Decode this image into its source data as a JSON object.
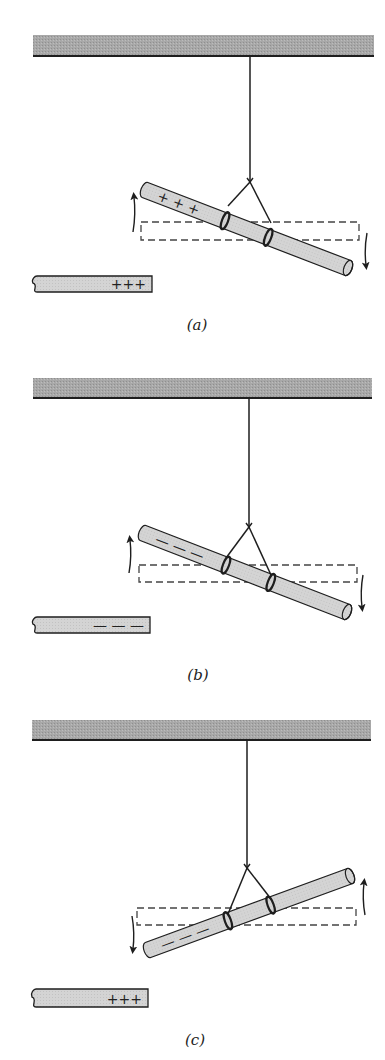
{
  "figure": {
    "colors": {
      "ceiling_fill": "#a6a6a6",
      "rod_fill": "#d2d2d2",
      "line": "#1e1e1e",
      "dashed": "#444444",
      "background": "#ffffff"
    },
    "panels": [
      {
        "id": "a",
        "caption": "(a)",
        "caption_pos": [
          197,
          325
        ],
        "suspended_rod_charge": "+ + +",
        "suspended_rod_charge_end": "left",
        "nearby_rod_charge": "+++",
        "rotation": "counterclockwise-left-up",
        "ceiling": {
          "x1": 33,
          "x2": 374,
          "top": 35,
          "bottom": 56
        },
        "string": {
          "x": 250,
          "top": 56,
          "split_y": 182
        },
        "rod": {
          "x1": 145,
          "y1": 190,
          "x2": 348,
          "y2": 268
        },
        "loops": [
          [
            228,
            213
          ],
          [
            271,
            230
          ]
        ],
        "dashed_rect": {
          "x": 141,
          "y": 222,
          "w": 218,
          "h": 18
        },
        "arrows": [
          {
            "side": "left",
            "x": 133,
            "y_from": 232,
            "y_to": 196,
            "dir": "up"
          },
          {
            "side": "right",
            "x": 367,
            "y_from": 233,
            "y_to": 266,
            "dir": "down"
          }
        ],
        "nearby_rod": {
          "x1": 33,
          "x2": 152,
          "top": 276,
          "bottom": 292
        }
      },
      {
        "id": "b",
        "caption": "(b)",
        "caption_pos": [
          198,
          675
        ],
        "suspended_rod_charge": "— — —",
        "suspended_rod_charge_end": "left",
        "nearby_rod_charge": "— — —",
        "rotation": "left-up",
        "ceiling": {
          "x1": 33,
          "x2": 372,
          "top": 378,
          "bottom": 398
        },
        "string": {
          "x": 249,
          "top": 398,
          "split_y": 527
        },
        "rod": {
          "x1": 143,
          "y1": 533,
          "x2": 347,
          "y2": 612
        },
        "loops": [
          [
            226,
            565
          ],
          [
            271,
            582
          ]
        ],
        "dashed_rect": {
          "x": 139,
          "y": 565,
          "w": 218,
          "h": 17
        },
        "arrows": [
          {
            "side": "left",
            "x": 129,
            "y_from": 573,
            "y_to": 539,
            "dir": "up"
          },
          {
            "side": "right",
            "x": 363,
            "y_from": 575,
            "y_to": 608,
            "dir": "down"
          }
        ],
        "nearby_rod": {
          "x1": 33,
          "x2": 150,
          "top": 617,
          "bottom": 633
        }
      },
      {
        "id": "c",
        "caption": "(c)",
        "caption_pos": [
          195,
          1040
        ],
        "suspended_rod_charge": "— — —",
        "suspended_rod_charge_end": "left",
        "nearby_rod_charge": "+++",
        "rotation": "left-down",
        "ceiling": {
          "x1": 32,
          "x2": 371,
          "top": 720,
          "bottom": 740
        },
        "string": {
          "x": 247,
          "top": 740,
          "split_y": 868
        },
        "rod": {
          "x1": 148,
          "y1": 950,
          "x2": 350,
          "y2": 876
        },
        "loops": [
          [
            228,
            921
          ],
          [
            271,
            906
          ]
        ],
        "dashed_rect": {
          "x": 137,
          "y": 908,
          "w": 219,
          "h": 17
        },
        "arrows": [
          {
            "side": "left",
            "x": 132,
            "y_from": 916,
            "y_to": 950,
            "dir": "down"
          },
          {
            "side": "right",
            "x": 365,
            "y_from": 915,
            "y_to": 882,
            "dir": "up"
          }
        ],
        "nearby_rod": {
          "x1": 32,
          "x2": 148,
          "top": 989,
          "bottom": 1007
        }
      }
    ]
  }
}
